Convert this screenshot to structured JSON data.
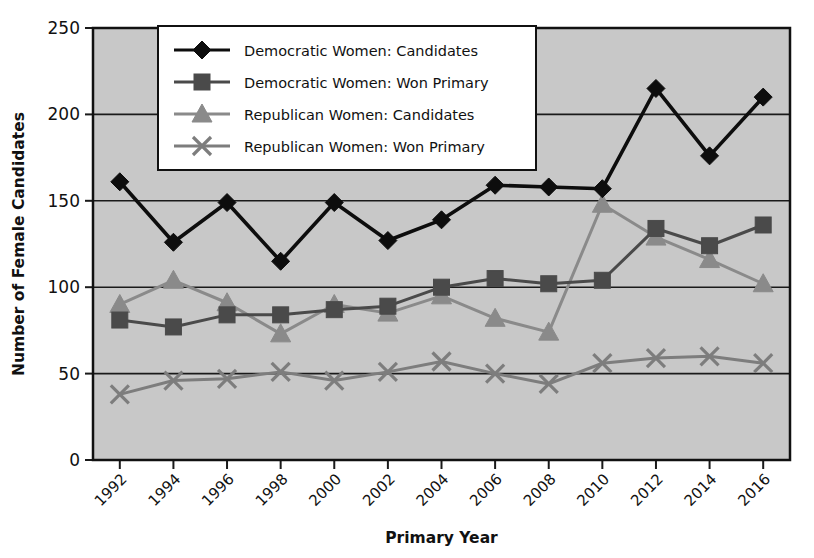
{
  "chart_data": {
    "type": "line",
    "title": "",
    "xlabel": "Primary Year",
    "ylabel": "Number of Female Candidates",
    "categories": [
      "1992",
      "1994",
      "1996",
      "1998",
      "2000",
      "2002",
      "2004",
      "2006",
      "2008",
      "2010",
      "2012",
      "2014",
      "2016"
    ],
    "ylim": [
      0,
      250
    ],
    "ytick_labels": [
      "0",
      "50",
      "100",
      "150",
      "200",
      "250"
    ],
    "yticks": [
      0,
      50,
      100,
      150,
      200,
      250
    ],
    "grid": "horizontal",
    "legend_position": "top-center",
    "plot_background": "#c8c8c8",
    "series": [
      {
        "name": "Democratic Women: Candidates",
        "marker": "diamond",
        "color": "#0d0d0d",
        "values": [
          161,
          126,
          149,
          115,
          149,
          127,
          139,
          159,
          158,
          157,
          215,
          176,
          210
        ]
      },
      {
        "name": "Democratic Women: Won Primary",
        "marker": "square",
        "color": "#4a4a4a",
        "values": [
          81,
          77,
          84,
          84,
          87,
          89,
          100,
          105,
          102,
          104,
          134,
          124,
          136
        ]
      },
      {
        "name": "Republican Women: Candidates",
        "marker": "triangle",
        "color": "#8a8a8a",
        "values": [
          90,
          104,
          91,
          73,
          90,
          85,
          95,
          82,
          74,
          148,
          129,
          116,
          102
        ]
      },
      {
        "name": "Republican Women: Won Primary",
        "marker": "cross",
        "color": "#7d7d7d",
        "values": [
          38,
          46,
          47,
          51,
          46,
          51,
          57,
          50,
          44,
          56,
          59,
          60,
          56
        ]
      }
    ]
  }
}
